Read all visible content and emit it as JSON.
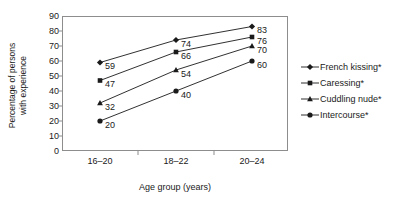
{
  "chart_data": {
    "type": "line",
    "title": "",
    "xlabel": "Age group (years)",
    "ylabel": "Percentage of persons with experience",
    "ylabel_line1": "Percentage of persons",
    "ylabel_line2": "with experience",
    "categories": [
      "16–20",
      "18–22",
      "20–24"
    ],
    "ylim": [
      0,
      90
    ],
    "yticks": [
      0,
      10,
      20,
      30,
      40,
      50,
      60,
      70,
      80,
      90
    ],
    "ytick_labels": [
      "0",
      "10",
      "20",
      "30",
      "40",
      "50",
      "60",
      "70",
      "80",
      "90"
    ],
    "grid": false,
    "legend_position": "right",
    "series": [
      {
        "name": "French kissing*",
        "marker": "diamond",
        "values": [
          59,
          74,
          83
        ],
        "labels": [
          "59",
          "74",
          "83"
        ]
      },
      {
        "name": "Caressing*",
        "marker": "square",
        "values": [
          47,
          66,
          76
        ],
        "labels": [
          "47",
          "66",
          "76"
        ]
      },
      {
        "name": "Cuddling nude*",
        "marker": "triangle",
        "values": [
          32,
          54,
          70
        ],
        "labels": [
          "32",
          "54",
          "70"
        ]
      },
      {
        "name": "Intercourse*",
        "marker": "circle",
        "values": [
          20,
          40,
          60
        ],
        "labels": [
          "20",
          "40",
          "60"
        ]
      }
    ],
    "colors": {
      "series": "#1a1a1a",
      "axis": "#8d8d8d",
      "text": "#1a1a1a",
      "background": "#ffffff"
    }
  }
}
